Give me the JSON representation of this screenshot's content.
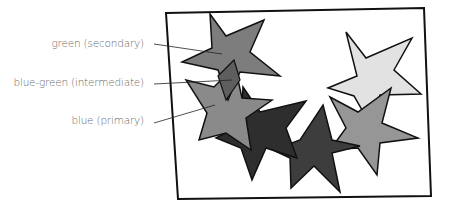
{
  "labels": [
    {
      "text": "green (secondary)",
      "color_name": "green",
      "role": "secondary"
    },
    {
      "text": "blue-green (intermediate)",
      "color_name": "blue-green",
      "role": "intermediate"
    },
    {
      "text": "blue (primary)",
      "color_name": "blue",
      "role": "primary"
    }
  ],
  "colors": {
    "green_star": "#7d7d7d",
    "blue_green_overlap": "#5e5e5e",
    "blue_star": "#8a8a8a",
    "dark_star": "#2e2e2e",
    "dark_star_2": "#3d3d3d",
    "light_star": "#e2e2e2",
    "mid_star": "#969696",
    "outline": "#111111",
    "label_text": "#6a6a6a"
  }
}
